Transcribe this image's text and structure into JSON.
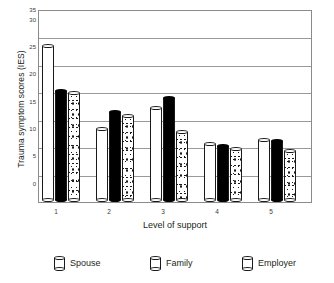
{
  "chart_data": {
    "type": "bar",
    "title": "",
    "xlabel": "Level of support",
    "ylabel": "Trauma symptom scores (IES)",
    "categories": [
      "1",
      "2",
      "3",
      "4",
      "5"
    ],
    "ylim": [
      0,
      35
    ],
    "yticks": [
      "0",
      "5",
      "10",
      "15",
      "20",
      "25",
      "30",
      "35"
    ],
    "grid": true,
    "legend_position": "bottom",
    "series": [
      {
        "name": "Spouse",
        "values": [
          29.0,
          13.7,
          17.6,
          11.0,
          11.8
        ]
      },
      {
        "name": "Family",
        "values": [
          20.7,
          16.9,
          19.4,
          10.6,
          11.5
        ]
      },
      {
        "name": "Employer",
        "values": [
          20.3,
          16.1,
          13.2,
          10.0,
          9.7
        ]
      }
    ]
  },
  "legend": {
    "items": [
      {
        "label": "Spouse",
        "icon": "cylinder-white-icon"
      },
      {
        "label": "Family",
        "icon": "cylinder-black-icon"
      },
      {
        "label": "Employer",
        "icon": "cylinder-dotted-icon"
      }
    ]
  }
}
